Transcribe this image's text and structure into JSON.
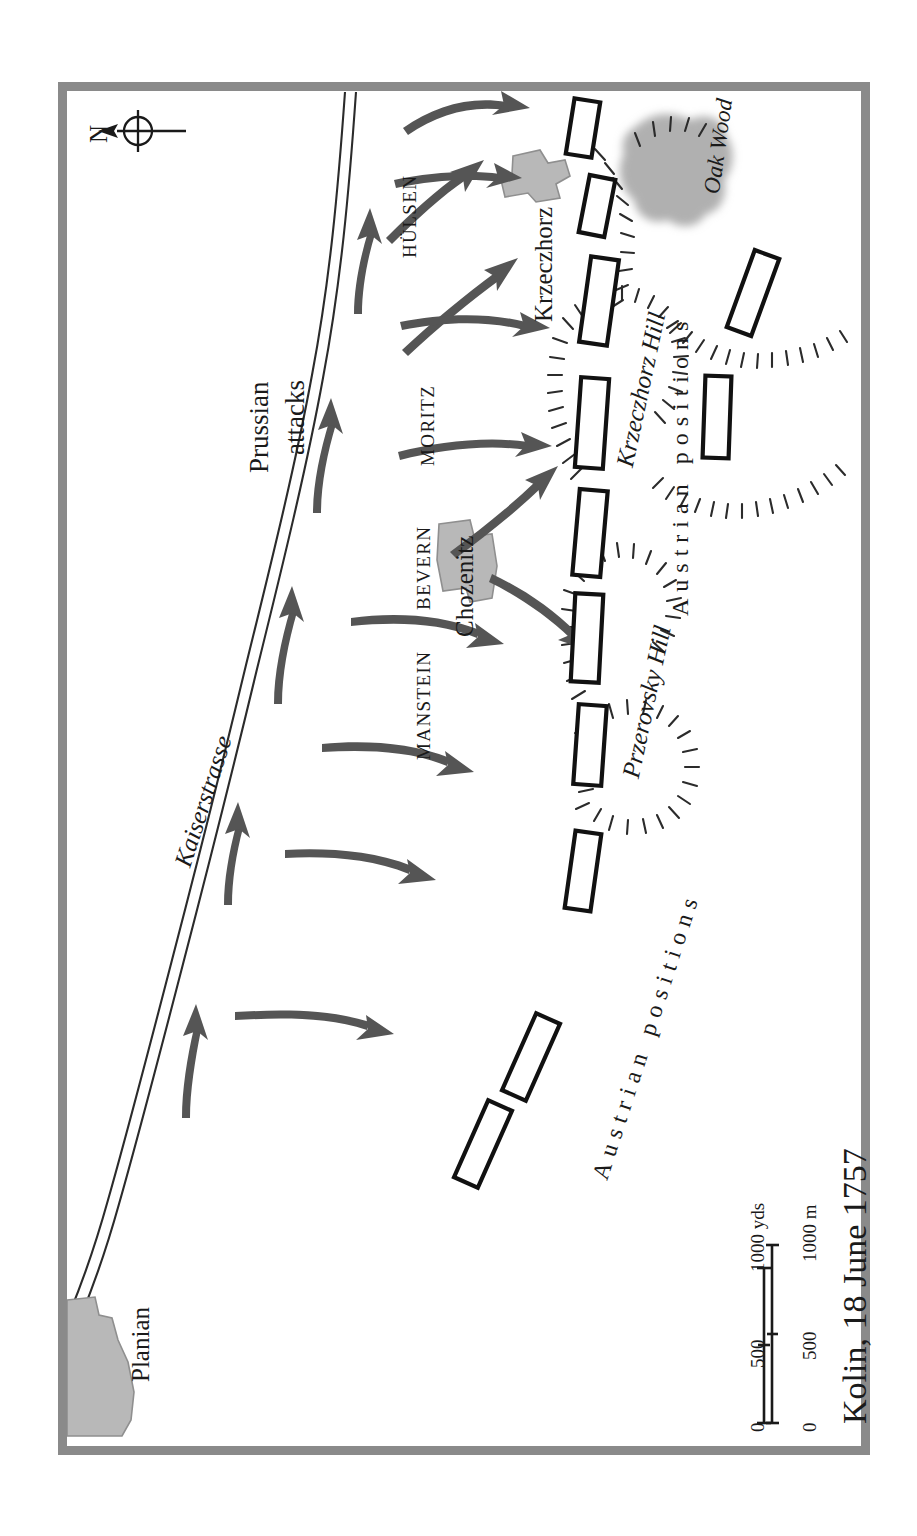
{
  "map": {
    "title": "Kolin, 18 June 1757",
    "orientation_note": "N",
    "compass": {
      "label": "N",
      "icon": "compass-arrow-icon"
    },
    "frame_color": "#8a8a8a",
    "arrow_color": "#555555",
    "village_fill": "#b8b8b8",
    "wood_fill": "#b0b0b0",
    "unit_stroke": "#111111",
    "unit_fill": "#ffffff"
  },
  "commanders": [
    {
      "name": "MANSTEIN"
    },
    {
      "name": "BEVERN"
    },
    {
      "name": "MORITZ"
    },
    {
      "name": "HÜLSEN"
    }
  ],
  "settlements": [
    {
      "name": "Planian"
    },
    {
      "name": "Chozenitz"
    },
    {
      "name": "Krzeczhorz"
    }
  ],
  "terrain": [
    {
      "name": "Przerovsky Hill",
      "type": "hill"
    },
    {
      "name": "Krzeczhorz Hill",
      "type": "hill"
    },
    {
      "name": "Oak Wood",
      "type": "wood"
    }
  ],
  "roads": [
    {
      "name": "Kaiserstrasse"
    }
  ],
  "force_labels": [
    {
      "text": "Prussian attacks",
      "line1": "Prussian",
      "line2": "attacks"
    },
    {
      "text": "Austrian positions",
      "id": "austrian-positions-north"
    },
    {
      "text": "Austrian positions",
      "id": "austrian-positions-south"
    }
  ],
  "scale": {
    "yards": {
      "unit": "yds",
      "ticks": [
        "0",
        "500",
        "1000 yds"
      ],
      "zero": "0",
      "mid": "500",
      "max": "1000 yds"
    },
    "metres": {
      "unit": "m",
      "ticks": [
        "0",
        "500",
        "1000 m"
      ],
      "zero": "0",
      "mid": "500",
      "max": "1000 m"
    }
  }
}
